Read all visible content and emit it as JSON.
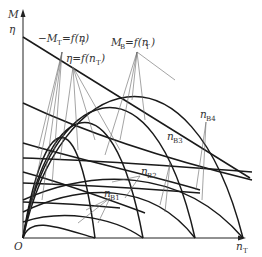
{
  "diagram": {
    "type": "characteristic curves diagram",
    "axes": {
      "y_label_top": "M",
      "y_label_second": "η",
      "x_label": "n",
      "x_label_sub": "T",
      "origin_label": "O"
    },
    "labels": {
      "torque_turbine": {
        "prefix": "−M",
        "sub": "T",
        "rest": "=f(n",
        "sub2": "T",
        "close": ")"
      },
      "efficiency": {
        "prefix": "η=f(n",
        "sub": "T",
        "close": ")"
      },
      "torque_pump": {
        "prefix": "M",
        "sub": "B",
        "rest": "=f(n",
        "sub2": "T",
        "close": ")"
      },
      "speed_labels": [
        {
          "main": "n",
          "sub": "B1"
        },
        {
          "main": "n",
          "sub": "B2"
        },
        {
          "main": "n",
          "sub": "B3"
        },
        {
          "main": "n",
          "sub": "B4"
        }
      ]
    },
    "colors": {
      "curve": "#1a1a1a",
      "leader": "#666666",
      "text": "#333333",
      "background": "#ffffff"
    }
  }
}
